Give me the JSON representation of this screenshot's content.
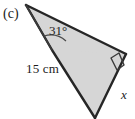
{
  "figure": {
    "part_label": "(c)",
    "shape": "triangle",
    "fill_color": "#d6d6d6",
    "stroke_color": "#262626",
    "background_color": "#ffffff",
    "labels": {
      "angle": "31°",
      "side_left": "15 cm",
      "side_right": "x"
    },
    "markers": {
      "right_angle": "right-angle-square",
      "angle_arc": "angle-arc-31"
    },
    "vertices": {
      "apex": [
        26,
        5
      ],
      "inner": [
        52,
        50
      ],
      "bottom": [
        95,
        118
      ],
      "right": [
        126,
        54
      ]
    }
  }
}
